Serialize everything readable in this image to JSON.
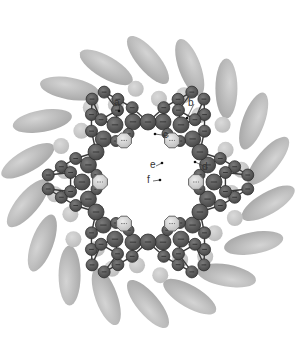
{
  "figure": {
    "type": "molecular-ring-diagram",
    "center": [
      148,
      182
    ],
    "colors": {
      "ellipse": "#b4b4b4",
      "light_sphere": "#c8c8c8",
      "dark_atom": "#555555",
      "octagon_atom": "#d2d2d2",
      "bond": "#3a3a3a",
      "label": "#333333"
    },
    "outer_ellipses": {
      "count": 18,
      "radius": 122,
      "rx": 30,
      "ry": 11,
      "tilt_deg": 50
    },
    "light_spheres": {
      "count": 24,
      "radius": 88,
      "r": 8
    },
    "octagons": {
      "count": 6,
      "radius": 48,
      "r": 8
    },
    "labels": [
      {
        "text": "a",
        "x": 117,
        "y": 106,
        "tx": 119,
        "ty": 111
      },
      {
        "text": "b",
        "x": 191,
        "y": 106,
        "tx": 187,
        "ty": 118
      },
      {
        "text": "c",
        "x": 166,
        "y": 138,
        "tx": 155,
        "ty": 134
      },
      {
        "text": "d",
        "x": 205,
        "y": 170,
        "tx": 195,
        "ty": 162
      },
      {
        "text": "e",
        "x": 153,
        "y": 168,
        "tx": 162,
        "ty": 163
      },
      {
        "text": "f",
        "x": 150,
        "y": 183,
        "tx": 160,
        "ty": 180
      }
    ]
  }
}
